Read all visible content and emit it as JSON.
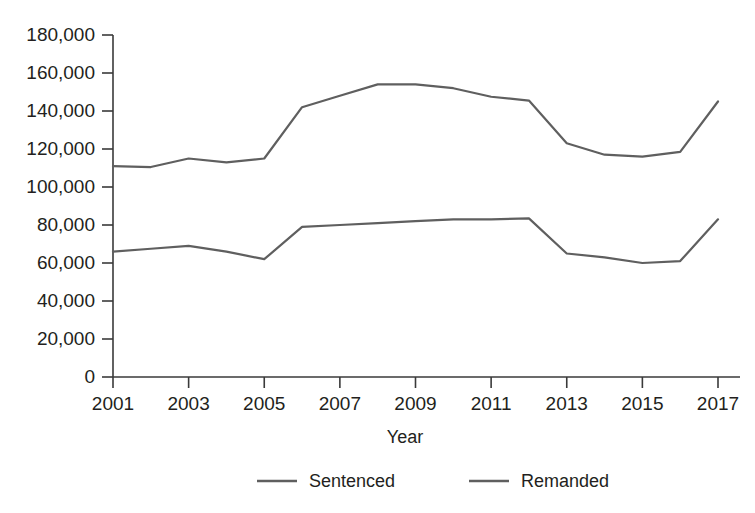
{
  "chart_data": {
    "type": "line",
    "title": "",
    "subtitle": "",
    "xlabel": "Year",
    "ylabel": "",
    "x": [
      2001,
      2002,
      2003,
      2004,
      2005,
      2006,
      2007,
      2008,
      2009,
      2010,
      2011,
      2012,
      2013,
      2014,
      2015,
      2016,
      2017
    ],
    "xlim": [
      2001,
      2017
    ],
    "ylim": [
      0,
      180000
    ],
    "grid": false,
    "legend_position": "bottom",
    "x_tick_labels": [
      "2001",
      "2003",
      "2005",
      "2007",
      "2009",
      "2011",
      "2013",
      "2015",
      "2017"
    ],
    "x_tick_values": [
      2001,
      2003,
      2005,
      2007,
      2009,
      2011,
      2013,
      2015,
      2017
    ],
    "y_tick_labels": [
      "0",
      "20,000",
      "40,000",
      "60,000",
      "80,000",
      "100,000",
      "120,000",
      "140,000",
      "160,000",
      "180,000"
    ],
    "y_tick_values": [
      0,
      20000,
      40000,
      60000,
      80000,
      100000,
      120000,
      140000,
      160000,
      180000
    ],
    "series": [
      {
        "name": "Sentenced",
        "color": "#5f5f5f",
        "values": [
          111000,
          110500,
          115000,
          113000,
          115000,
          142000,
          148000,
          154000,
          154000,
          152000,
          147500,
          145500,
          123000,
          117000,
          116000,
          118500,
          145000
        ]
      },
      {
        "name": "Remanded",
        "color": "#5f5f5f",
        "values": [
          66000,
          67500,
          69000,
          66000,
          62000,
          79000,
          80000,
          81000,
          82000,
          83000,
          83000,
          83500,
          65000,
          63000,
          60000,
          61000,
          83000
        ]
      }
    ]
  },
  "legend": {
    "items": [
      {
        "label": "Sentenced"
      },
      {
        "label": "Remanded"
      }
    ]
  },
  "axes": {
    "x_title": "Year",
    "y_title": ""
  }
}
